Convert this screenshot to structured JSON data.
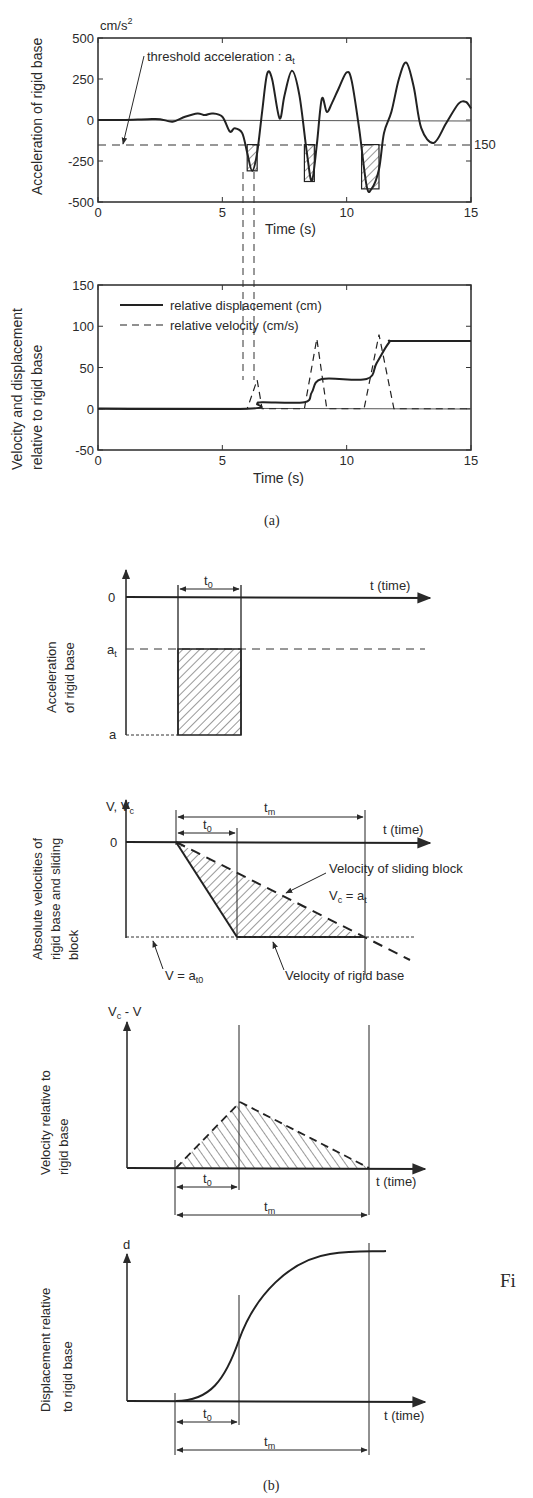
{
  "figure": {
    "caption_a": "(a)",
    "caption_b": "(b)",
    "side_text": "Fi"
  },
  "chart_data": [
    {
      "type": "line",
      "id": "acceleration",
      "ylabel": "Acceleration of rigid  base",
      "xlabel": "Time (s)",
      "yunit": "cm/s",
      "yunit_sup": "2",
      "xlim": [
        0,
        15
      ],
      "ylim": [
        -500,
        500
      ],
      "xticks": [
        "0",
        "5",
        "10",
        "15"
      ],
      "yticks": [
        "500",
        "250",
        "0",
        "-250",
        "-500"
      ],
      "threshold": {
        "value": -150,
        "label": "threshold acceleration : a",
        "label_sub": "t",
        "right_label": "150"
      },
      "series": [
        {
          "name": "acceleration",
          "x": [
            0,
            1,
            2,
            2.5,
            3,
            3.5,
            4,
            4.3,
            4.6,
            5,
            5.3,
            5.5,
            5.8,
            6,
            6.2,
            6.4,
            6.6,
            6.8,
            7,
            7.3,
            7.5,
            7.8,
            8.1,
            8.4,
            8.6,
            8.8,
            9,
            9.2,
            9.4,
            9.7,
            10,
            10.2,
            10.5,
            10.8,
            11,
            11.3,
            11.5,
            11.8,
            12.1,
            12.4,
            12.7,
            13,
            13.5,
            14,
            14.5,
            14.8,
            15
          ],
          "values": [
            0,
            0,
            5,
            5,
            -10,
            20,
            40,
            30,
            40,
            20,
            -70,
            -50,
            -80,
            -200,
            -310,
            -200,
            50,
            280,
            250,
            10,
            150,
            300,
            150,
            -200,
            -370,
            -150,
            130,
            50,
            100,
            200,
            290,
            240,
            -50,
            -400,
            -420,
            -300,
            -80,
            50,
            250,
            350,
            200,
            -50,
            -140,
            -20,
            100,
            110,
            70
          ]
        }
      ],
      "shaded_intervals": [
        [
          6.0,
          6.4,
          -310
        ],
        [
          8.3,
          8.7,
          -375
        ],
        [
          10.6,
          11.3,
          -420
        ]
      ]
    },
    {
      "type": "line",
      "id": "relative_motion",
      "ylabel_line1": "Velocity and displacement",
      "ylabel_line2": "relative to rigid base",
      "xlabel": "Time (s)",
      "xlim": [
        0,
        15
      ],
      "ylim": [
        -50,
        150
      ],
      "xticks": [
        "0",
        "5",
        "10",
        "15"
      ],
      "yticks": [
        "150",
        "100",
        "50",
        "0",
        "-50"
      ],
      "legend": [
        "relative displacement (cm)",
        "relative  velocity (cm/s)"
      ],
      "series": [
        {
          "name": "relative displacement (cm)",
          "style": "solid",
          "x": [
            0,
            6,
            6.4,
            6.6,
            8.3,
            8.6,
            9,
            10.8,
            11.2,
            11.7,
            12,
            15
          ],
          "values": [
            0,
            0,
            6,
            8,
            8,
            20,
            36,
            36,
            55,
            80,
            82,
            82
          ]
        },
        {
          "name": "relative velocity (cm/s)",
          "style": "dashed",
          "x": [
            0,
            6,
            6.4,
            6.6,
            8.3,
            8.8,
            9.2,
            10.7,
            11.3,
            11.9,
            15
          ],
          "values": [
            0,
            0,
            35,
            0,
            0,
            85,
            0,
            0,
            90,
            0,
            0
          ]
        }
      ]
    }
  ],
  "schematic": {
    "panel1": {
      "ylabel_line1": "Acceleration",
      "ylabel_line2": "of rigid base",
      "y_zero": "0",
      "y_at": "a",
      "y_at_sub": "t",
      "y_a": "a",
      "t0": "t",
      "t0_sub": "0",
      "xaxis": "t (time)"
    },
    "panel2": {
      "ylabel_line1": "Absolute velocities of",
      "ylabel_line2": "rigid base and sliding",
      "ylabel_line3": "block",
      "yaxis": "V, V",
      "yaxis_sub": "c",
      "y_zero": "0",
      "tm": "t",
      "tm_sub": "m",
      "t0": "t",
      "t0_sub": "0",
      "xaxis": "t (time)",
      "sliding_label": "Velocity of sliding block",
      "sliding_eq": "V",
      "sliding_eq_sub": "c",
      "sliding_eq_rhs": " = a",
      "sliding_eq_rhs_sub": "t",
      "base_eq": "V = a",
      "base_eq_sub": "t0",
      "base_label": "Velocity of  rigid base"
    },
    "panel3": {
      "ylabel_line1": "Velocity relative to",
      "ylabel_line2": "rigid base",
      "yaxis": "V",
      "yaxis_sub": "c",
      "yaxis_rest": " - V",
      "t0": "t",
      "t0_sub": "0",
      "tm": "t",
      "tm_sub": "m",
      "xaxis": "t (time)"
    },
    "panel4": {
      "ylabel_line1": "Displacement relative",
      "ylabel_line2": "to rigid base",
      "yaxis": "d",
      "t0": "t",
      "t0_sub": "0",
      "tm": "t",
      "tm_sub": "m",
      "xaxis": "t (time)"
    }
  }
}
